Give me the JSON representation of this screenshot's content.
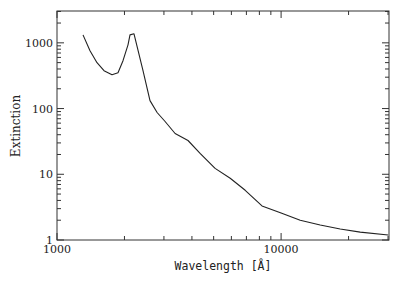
{
  "chart_data": {
    "type": "line",
    "title": "",
    "xlabel": "Wavelength [Å]",
    "ylabel": "Extinction",
    "xscale": "log",
    "yscale": "log",
    "xlim": [
      1000,
      30300
    ],
    "ylim": [
      1,
      3050
    ],
    "grid": false,
    "legend": null,
    "x_tick_labels": [
      "1000",
      "10000"
    ],
    "y_tick_labels": [
      "1",
      "10",
      "100",
      "1000"
    ],
    "x_major_ticks": [
      1000,
      10000
    ],
    "x_minor_ticks": [
      2000,
      3000,
      4000,
      5000,
      6000,
      7000,
      8000,
      9000,
      20000,
      30000
    ],
    "y_major_ticks": [
      1,
      10,
      100,
      1000
    ],
    "series": [
      {
        "name": "Extinction curve",
        "color": "#222222",
        "x": [
          1306,
          1404,
          1509,
          1621,
          1760,
          1872,
          1971,
          2074,
          2117,
          2207,
          2420,
          2600,
          2796,
          3035,
          3366,
          3843,
          4350,
          5078,
          5925,
          6915,
          8217,
          10000,
          12170,
          14940,
          18350,
          22540,
          30040
        ],
        "y": [
          1322,
          757,
          498,
          377,
          327,
          351,
          534,
          933,
          1322,
          1370,
          377,
          132,
          87,
          63.5,
          41.8,
          32.7,
          20.8,
          12.3,
          8.7,
          5.7,
          3.3,
          2.57,
          2.0,
          1.69,
          1.47,
          1.32,
          1.19
        ]
      }
    ]
  },
  "plot_frame": {
    "left": 57,
    "top": 11,
    "right": 389,
    "bottom": 240
  }
}
